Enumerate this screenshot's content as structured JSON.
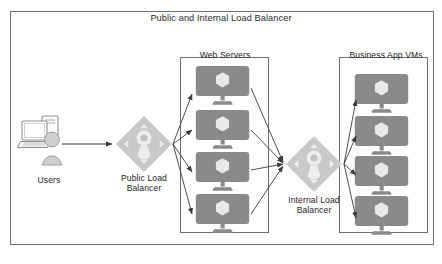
{
  "diagram": {
    "title": "Public and Internal Load Balancer",
    "type": "network-architecture",
    "frame": {
      "stroke": "#6f6f6f"
    },
    "colors": {
      "device_fill": "#8a8a8a",
      "device_glyph": "#e9e9e9",
      "diamond_fill": "#c9c9c9",
      "diamond_glyph": "#ededed",
      "arrow": "#3a3a3a",
      "group_border": "#6f6f6f",
      "text": "#262626"
    },
    "groups": [
      {
        "id": "web-servers",
        "label": "Web Servers",
        "node_count": 4,
        "icon": "server-monitor-icon"
      },
      {
        "id": "business-app-vms",
        "label": "Business App VMs",
        "node_count": 4,
        "icon": "server-monitor-icon"
      }
    ],
    "nodes": [
      {
        "id": "users",
        "label": "Users",
        "icon": "users-workstation-icon"
      },
      {
        "id": "public-load-balancer",
        "label": "Public Load\nBalancer",
        "icon": "load-balancer-diamond-icon"
      },
      {
        "id": "internal-load-balancer",
        "label": "Internal Load\nBalancer",
        "icon": "load-balancer-diamond-icon"
      }
    ],
    "flows": [
      {
        "from": "users",
        "to": "public-load-balancer"
      },
      {
        "from": "public-load-balancer",
        "to": "web-servers"
      },
      {
        "from": "web-servers",
        "to": "internal-load-balancer"
      },
      {
        "from": "internal-load-balancer",
        "to": "business-app-vms"
      }
    ],
    "footer_note": ""
  }
}
